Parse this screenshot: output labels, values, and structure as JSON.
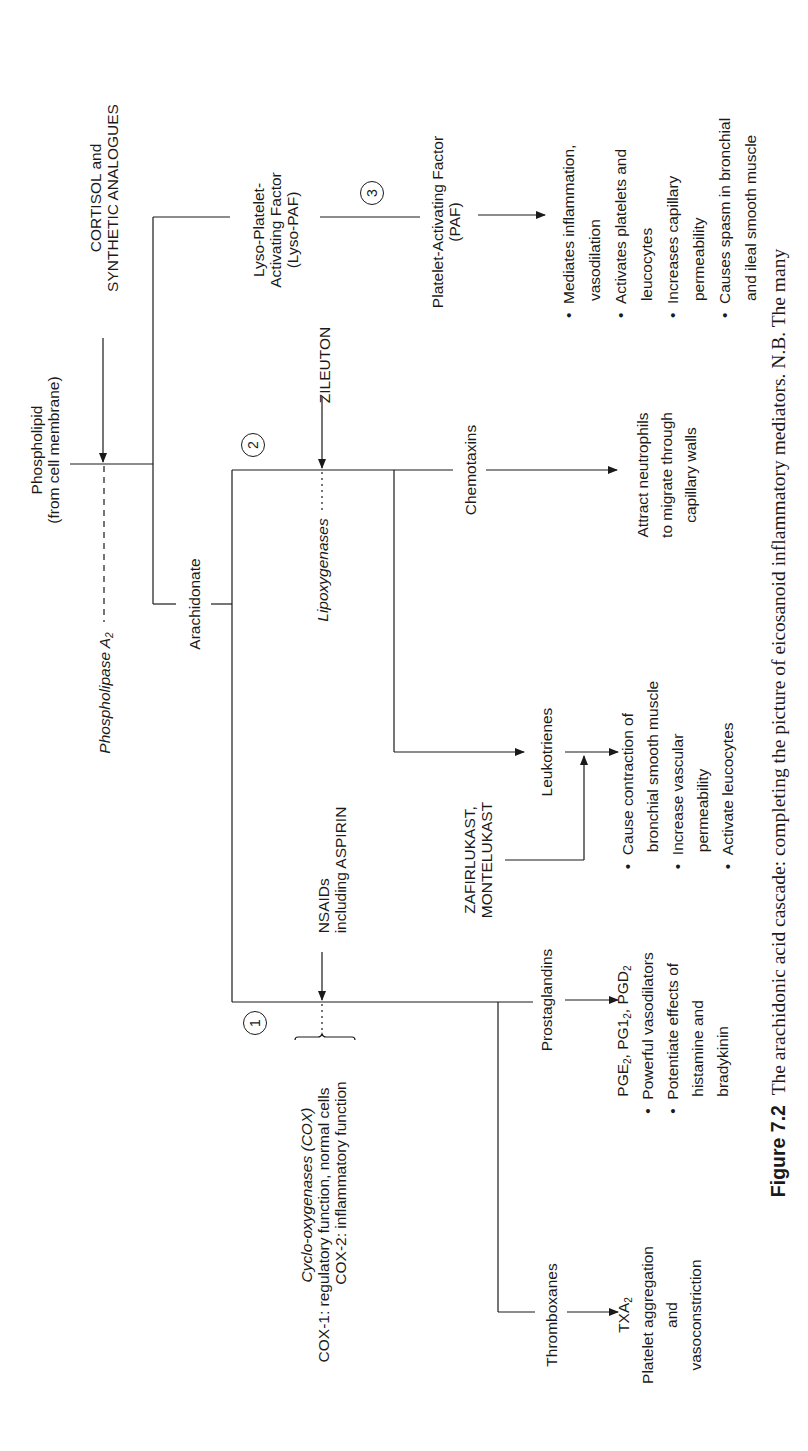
{
  "diagram": {
    "title": "The arachidonic acid cascade",
    "nodes": {
      "phospholipid": [
        "Phospholipid",
        "(from cell membrane)"
      ],
      "phospholipase": "Phospholipase A",
      "phospholipase_sub": "2",
      "cortisol": [
        "CORTISOL and",
        "SYNTHETIC ANALOGUES"
      ],
      "arachidonate": "Arachidonate",
      "lyso_paf": [
        "Lyso-Platelet-",
        "Activating Factor",
        "(Lyso-PAF)"
      ],
      "paf": [
        "Platelet-Activating Factor",
        "(PAF)"
      ],
      "paf_effects": [
        "Mediates inflammation,",
        "vasodilation",
        "Activates platelets and",
        "leucocytes",
        "Increases capillary",
        "permeability",
        "Causes spasm in bronchial",
        "and ileal smooth muscle"
      ],
      "zileuton": "ZILEUTON",
      "lipoxygenases": "Lipoxygenases",
      "chemotaxins": "Chemotaxins",
      "chemotaxins_effects": [
        "Attract neutrophils",
        "to migrate through",
        "capillary walls"
      ],
      "leukotrienes": "Leukotrienes",
      "zafirlukast": [
        "ZAFIRLUKAST,",
        "MONTELUKAST"
      ],
      "leukotrienes_effects": [
        "Cause contraction of",
        "bronchial smooth muscle",
        "Increase vascular",
        "permeability",
        "Activate leucocytes"
      ],
      "nsaids": [
        "NSAIDs",
        "including ASPIRIN"
      ],
      "cox": "Cyclo-oxygenases (COX)",
      "cox1": "COX-1: regulatory function, normal cells",
      "cox2": "COX-2: inflammatory function",
      "prostaglandins": "Prostaglandins",
      "prostaglandins_head": {
        "a": "PGE",
        "a_sub": "2",
        "b": ", PG1",
        "b_sub": "2",
        "c": ", PGD",
        "c_sub": "2"
      },
      "prostaglandins_effects": [
        "Powerful vasodilators",
        "Potentiate effects of",
        "histamine and",
        "bradykinin"
      ],
      "thromboxanes": "Thromboxanes",
      "txa": "TXA",
      "txa_sub": "2",
      "thromboxanes_effects": [
        "Platelet aggregation",
        "and",
        "vasoconstriction"
      ]
    },
    "markers": {
      "one": "1",
      "two": "2",
      "three": "3"
    },
    "bullet": "•"
  },
  "caption": {
    "label": "Figure 7.2",
    "text": "The arachidonic acid cascade: completing the picture of eicosanoid inflammatory mediators. N.B. The many"
  }
}
